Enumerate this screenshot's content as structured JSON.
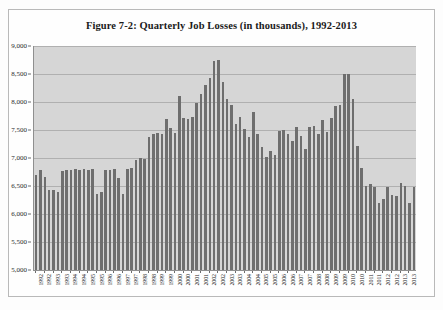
{
  "figure": {
    "title": "Figure 7-2: Quarterly Job Losses (in thousands), 1992-2013"
  },
  "chart_data": {
    "type": "bar",
    "title": "Figure 7-2: Quarterly Job Losses (in thousands), 1992-2013",
    "xlabel": "",
    "ylabel": "",
    "ylim": [
      5000,
      9000
    ],
    "ytick_labels": [
      "9,000",
      "8,500",
      "8,000",
      "7,500",
      "7,000",
      "6,500",
      "6,000",
      "5,500",
      "5,000"
    ],
    "ytick_values": [
      9000,
      8500,
      8000,
      7500,
      7000,
      6500,
      6000,
      5500,
      5000
    ],
    "grid": true,
    "legend": false,
    "bar_color": "#6e6e6e",
    "plot_background": "#d6d6d6",
    "categories": [
      "1992 Q1",
      "1992 Q2",
      "1992 Q3",
      "1992 Q4",
      "1993 Q1",
      "1993 Q2",
      "1993 Q3",
      "1993 Q4",
      "1994 Q1",
      "1994 Q2",
      "1994 Q3",
      "1994 Q4",
      "1995 Q1",
      "1995 Q2",
      "1995 Q3",
      "1995 Q4",
      "1996 Q1",
      "1996 Q2",
      "1996 Q3",
      "1996 Q4",
      "1997 Q1",
      "1997 Q2",
      "1997 Q3",
      "1997 Q4",
      "1998 Q1",
      "1998 Q2",
      "1998 Q3",
      "1998 Q4",
      "1999 Q1",
      "1999 Q2",
      "1999 Q3",
      "1999 Q4",
      "2000 Q1",
      "2000 Q2",
      "2000 Q3",
      "2000 Q4",
      "2001 Q1",
      "2001 Q2",
      "2001 Q3",
      "2001 Q4",
      "2002 Q1",
      "2002 Q2",
      "2002 Q3",
      "2002 Q4",
      "2003 Q1",
      "2003 Q2",
      "2003 Q3",
      "2003 Q4",
      "2004 Q1",
      "2004 Q2",
      "2004 Q3",
      "2004 Q4",
      "2005 Q1",
      "2005 Q2",
      "2005 Q3",
      "2005 Q4",
      "2006 Q1",
      "2006 Q2",
      "2006 Q3",
      "2006 Q4",
      "2007 Q1",
      "2007 Q2",
      "2007 Q3",
      "2007 Q4",
      "2008 Q1",
      "2008 Q2",
      "2008 Q3",
      "2008 Q4",
      "2009 Q1",
      "2009 Q2",
      "2009 Q3",
      "2009 Q4",
      "2010 Q1",
      "2010 Q2",
      "2010 Q3",
      "2010 Q4",
      "2011 Q1",
      "2011 Q2",
      "2011 Q3",
      "2011 Q4",
      "2012 Q1",
      "2012 Q2",
      "2012 Q3",
      "2012 Q4",
      "2013 Q1",
      "2013 Q2",
      "2013 Q3",
      "2013 Q4"
    ],
    "values": [
      6700,
      6780,
      6660,
      6420,
      6420,
      6400,
      6760,
      6780,
      6790,
      6800,
      6780,
      6800,
      6790,
      6800,
      6360,
      6400,
      6780,
      6790,
      6800,
      6640,
      6360,
      6800,
      6820,
      6960,
      7000,
      6980,
      7380,
      7420,
      7450,
      7420,
      7700,
      7540,
      7450,
      8100,
      7720,
      7700,
      7740,
      7980,
      8140,
      8300,
      8420,
      8730,
      8750,
      8350,
      8050,
      7940,
      7600,
      7740,
      7520,
      7380,
      7820,
      7420,
      7200,
      7020,
      7120,
      7060,
      7480,
      7500,
      7420,
      7300,
      7560,
      7400,
      7160,
      7560,
      7580,
      7420,
      7680,
      7460,
      7720,
      7920,
      7940,
      8500,
      8500,
      8060,
      7220,
      6830,
      6500,
      6530,
      6490,
      6200,
      6260,
      6480,
      6340,
      6320,
      6560,
      6500,
      6200,
      6480
    ],
    "xtick_labels": [
      "1992",
      "1992",
      "1993",
      "1993",
      "1994",
      "1994",
      "1995",
      "1995",
      "1996",
      "1996",
      "1997",
      "1997",
      "1998",
      "1998",
      "1999",
      "1999",
      "2000",
      "2000",
      "2001",
      "2001",
      "2002",
      "2002",
      "2003",
      "2003",
      "2004",
      "2004",
      "2005",
      "2005",
      "2006",
      "2006",
      "2007",
      "2007",
      "2008",
      "2008",
      "2009",
      "2009",
      "2010",
      "2010",
      "2011",
      "2011",
      "2012",
      "2012",
      "2013",
      "2013"
    ]
  }
}
